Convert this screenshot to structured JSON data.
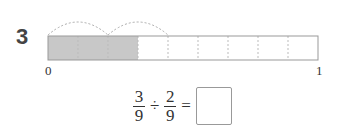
{
  "question": {
    "number": "3"
  },
  "bar_model": {
    "segments": 9,
    "shaded": 3,
    "arc_groups": [
      [
        0,
        2
      ],
      [
        2,
        4
      ]
    ],
    "start_label": "0",
    "end_label": "1",
    "colors": {
      "shaded": "#c8c8c8",
      "border": "#999999",
      "divider": "#bbbbbb"
    }
  },
  "equation": {
    "left": {
      "numerator": "3",
      "denominator": "9"
    },
    "operator": "÷",
    "right": {
      "numerator": "2",
      "denominator": "9"
    },
    "equals": "=",
    "answer": ""
  }
}
